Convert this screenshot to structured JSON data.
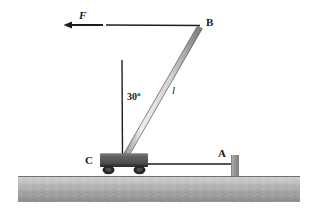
{
  "figure": {
    "type": "physics-free-body-diagram",
    "labels": {
      "force": "F",
      "point_b": "B",
      "point_a": "A",
      "point_c": "C",
      "rod_length": "l",
      "angle_value": "30",
      "angle_unit": "o",
      "angle_full": "30o"
    },
    "colors": {
      "ink": "#1a1a1a",
      "rod_fill": "#d6d6d6",
      "rod_stroke": "#6e6e6e",
      "cart_body": "#5d5d5d",
      "cart_body_dark": "#3f3f3f",
      "wheel": "#2b2b2b",
      "ground_top": "#cfcfcf",
      "ground_bottom": "#8f8f8f",
      "post": "#9b9b9b",
      "background": "#ffffff"
    },
    "geometry": {
      "force_arrow": {
        "tip_x": 64,
        "tail_x": 103,
        "y": 25
      },
      "top_beam": {
        "x1": 106,
        "x2": 200,
        "y": 25
      },
      "rod": {
        "top_x": 200,
        "top_y": 27,
        "bottom_x": 124,
        "bottom_y": 159
      },
      "vertical_reference": {
        "x": 122,
        "y_top": 60,
        "y_bottom": 159
      },
      "cart": {
        "x": 100,
        "y": 154,
        "w": 48,
        "h": 13
      },
      "link_line": {
        "x1": 148,
        "x2": 232,
        "y": 164
      },
      "post": {
        "x": 231,
        "y": 155,
        "w": 8,
        "h": 21
      },
      "ground": {
        "x": 18,
        "y": 176,
        "w": 282,
        "h": 26
      }
    }
  }
}
